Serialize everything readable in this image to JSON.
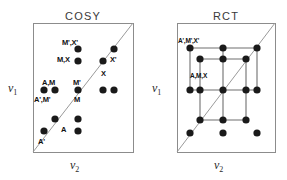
{
  "figure": {
    "background": "#ffffff",
    "dot_color": "#1a1a1a",
    "box_color": "#8c8c8c",
    "diagonal_color": "#9a9a9a",
    "grid_line_color": "#6f6f6f",
    "width": 287,
    "height": 180
  },
  "panels": [
    {
      "id": "cosy",
      "title": "COSY",
      "title_x": 83,
      "title_y": 10,
      "box": {
        "x": 33,
        "y": 23,
        "w": 100,
        "h": 129
      },
      "diagonal": {
        "x1": 33,
        "y1": 152,
        "x2": 133,
        "y2": 23
      },
      "axis_y": {
        "text": "v",
        "sub": "1",
        "x": 8,
        "y": 81
      },
      "axis_x": {
        "text": "v",
        "sub": "2",
        "x": 70,
        "y": 158
      },
      "dots": [
        {
          "cx": 78,
          "cy": 49
        },
        {
          "cx": 114,
          "cy": 49
        },
        {
          "cx": 78,
          "cy": 61
        },
        {
          "cx": 103,
          "cy": 61
        },
        {
          "cx": 44,
          "cy": 90
        },
        {
          "cx": 55,
          "cy": 90
        },
        {
          "cx": 78,
          "cy": 90
        },
        {
          "cx": 103,
          "cy": 90
        },
        {
          "cx": 114,
          "cy": 90
        },
        {
          "cx": 55,
          "cy": 119
        },
        {
          "cx": 78,
          "cy": 119
        },
        {
          "cx": 44,
          "cy": 131
        },
        {
          "cx": 78,
          "cy": 131
        }
      ],
      "labels": [
        {
          "text": "M',X'",
          "x": 62,
          "y": 38,
          "size": "normal"
        },
        {
          "text": "M,X",
          "x": 57,
          "y": 55,
          "size": "normal"
        },
        {
          "text": "X'",
          "x": 110,
          "y": 55,
          "size": "normal"
        },
        {
          "text": "X",
          "x": 101,
          "y": 69,
          "size": "normal"
        },
        {
          "text": "A,M",
          "x": 42,
          "y": 78,
          "size": "normal"
        },
        {
          "text": "M'",
          "x": 73,
          "y": 78,
          "size": "normal"
        },
        {
          "text": "A',M'",
          "x": 34,
          "y": 95,
          "size": "normal"
        },
        {
          "text": "M",
          "x": 74,
          "y": 95,
          "size": "normal"
        },
        {
          "text": "A",
          "x": 61,
          "y": 125,
          "size": "normal"
        },
        {
          "text": "A'",
          "x": 38,
          "y": 137,
          "size": "normal"
        }
      ]
    },
    {
      "id": "rct",
      "title": "RCT",
      "title_x": 226,
      "title_y": 10,
      "box": {
        "x": 177,
        "y": 23,
        "w": 98,
        "h": 129
      },
      "diagonal": {
        "x1": 177,
        "y1": 152,
        "x2": 275,
        "y2": 23
      },
      "axis_y": {
        "text": "v",
        "sub": "1",
        "x": 152,
        "y": 81
      },
      "axis_x": {
        "text": "v",
        "sub": "2",
        "x": 214,
        "y": 158
      },
      "dots": [
        {
          "cx": 190,
          "cy": 48
        },
        {
          "cx": 223,
          "cy": 48
        },
        {
          "cx": 257,
          "cy": 48
        },
        {
          "cx": 200,
          "cy": 59
        },
        {
          "cx": 223,
          "cy": 59
        },
        {
          "cx": 246,
          "cy": 59
        },
        {
          "cx": 190,
          "cy": 90
        },
        {
          "cx": 200,
          "cy": 90
        },
        {
          "cx": 223,
          "cy": 90
        },
        {
          "cx": 246,
          "cy": 90
        },
        {
          "cx": 257,
          "cy": 90
        },
        {
          "cx": 200,
          "cy": 120
        },
        {
          "cx": 223,
          "cy": 120
        },
        {
          "cx": 246,
          "cy": 120
        },
        {
          "cx": 190,
          "cy": 133
        },
        {
          "cx": 223,
          "cy": 133
        },
        {
          "cx": 257,
          "cy": 133
        }
      ],
      "grid_lines": [
        {
          "x1": 190,
          "y1": 48,
          "x2": 257,
          "y2": 48
        },
        {
          "x1": 190,
          "y1": 90,
          "x2": 257,
          "y2": 90
        },
        {
          "x1": 200,
          "y1": 59,
          "x2": 246,
          "y2": 59
        },
        {
          "x1": 200,
          "y1": 120,
          "x2": 246,
          "y2": 120
        },
        {
          "x1": 190,
          "y1": 48,
          "x2": 190,
          "y2": 90
        },
        {
          "x1": 257,
          "y1": 48,
          "x2": 257,
          "y2": 90
        },
        {
          "x1": 223,
          "y1": 48,
          "x2": 223,
          "y2": 90
        },
        {
          "x1": 200,
          "y1": 59,
          "x2": 200,
          "y2": 120
        },
        {
          "x1": 246,
          "y1": 59,
          "x2": 246,
          "y2": 120
        },
        {
          "x1": 223,
          "y1": 90,
          "x2": 223,
          "y2": 120
        }
      ],
      "labels": [
        {
          "text": "A',M',X'",
          "x": 178,
          "y": 37,
          "size": "tiny"
        },
        {
          "text": "A,M,X",
          "x": 190,
          "y": 72,
          "size": "tiny"
        }
      ]
    }
  ],
  "chart_data": {
    "type": "scatter",
    "xlabel": "v2",
    "ylabel": "v1",
    "grid": false,
    "legend": "none",
    "panels": [
      {
        "name": "COSY",
        "points": [
          {
            "x": 78,
            "y": 49,
            "label": "M',X'"
          },
          {
            "x": 114,
            "y": 49,
            "label": ""
          },
          {
            "x": 78,
            "y": 61,
            "label": "M,X"
          },
          {
            "x": 103,
            "y": 61,
            "label": "X'"
          },
          {
            "x": 44,
            "y": 90,
            "label": "A',M'"
          },
          {
            "x": 55,
            "y": 90,
            "label": "A,M"
          },
          {
            "x": 78,
            "y": 90,
            "label": "M'"
          },
          {
            "x": 103,
            "y": 90,
            "label": ""
          },
          {
            "x": 114,
            "y": 90,
            "label": ""
          },
          {
            "x": 55,
            "y": 119,
            "label": "A"
          },
          {
            "x": 78,
            "y": 119,
            "label": "M"
          },
          {
            "x": 44,
            "y": 131,
            "label": "A'"
          },
          {
            "x": 78,
            "y": 131,
            "label": ""
          }
        ],
        "diagonal": true,
        "point_count": 13
      },
      {
        "name": "RCT",
        "points": [
          {
            "x": 190,
            "y": 48,
            "label": "A',M',X'"
          },
          {
            "x": 223,
            "y": 48,
            "label": ""
          },
          {
            "x": 257,
            "y": 48,
            "label": ""
          },
          {
            "x": 200,
            "y": 59,
            "label": ""
          },
          {
            "x": 223,
            "y": 59,
            "label": ""
          },
          {
            "x": 246,
            "y": 59,
            "label": ""
          },
          {
            "x": 190,
            "y": 90,
            "label": ""
          },
          {
            "x": 200,
            "y": 90,
            "label": "A,M,X"
          },
          {
            "x": 223,
            "y": 90,
            "label": ""
          },
          {
            "x": 246,
            "y": 90,
            "label": ""
          },
          {
            "x": 257,
            "y": 90,
            "label": ""
          },
          {
            "x": 200,
            "y": 120,
            "label": ""
          },
          {
            "x": 223,
            "y": 120,
            "label": ""
          },
          {
            "x": 246,
            "y": 120,
            "label": ""
          },
          {
            "x": 190,
            "y": 133,
            "label": ""
          },
          {
            "x": 223,
            "y": 133,
            "label": ""
          },
          {
            "x": 257,
            "y": 133,
            "label": ""
          }
        ],
        "diagonal": true,
        "point_count": 17
      }
    ]
  }
}
